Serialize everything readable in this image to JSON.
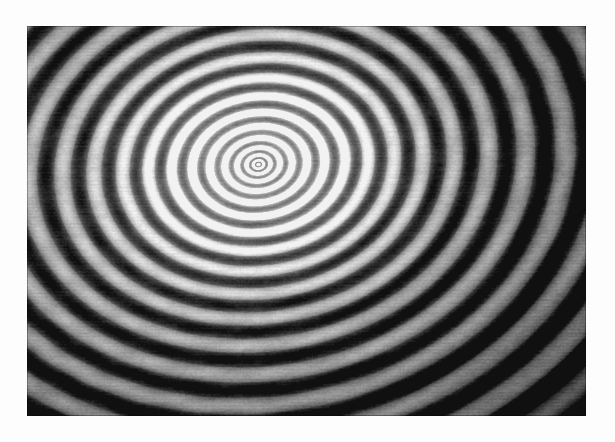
{
  "page": {
    "background_color": "#fdfdfd",
    "width": 615,
    "height": 442
  },
  "figure": {
    "name": "interference-fringe-photograph",
    "kind": "photographic-plate",
    "description": "Monochrome photographic plate showing concentric circular interference fringes (Fabry-Perot / Newton's rings) rendered elliptical by oblique viewing.",
    "plate": {
      "x": 27,
      "y": 26,
      "width": 559,
      "height": 390,
      "border_color": "#8f8f8f",
      "tone_dark": "#2b2b2b",
      "tone_mid": "#8a8a8a",
      "tone_light": "#f2f2f2"
    }
  },
  "chart_data": {
    "type": "heatmap",
    "title": "",
    "subtitle": "",
    "xlabel": "",
    "ylabel": "",
    "legend": [],
    "annotations": [],
    "grid": false,
    "pattern": "concentric-interference-fringes",
    "center": {
      "x": 258,
      "y": 164
    },
    "ellipse": {
      "aspect_ratio_x": 1.0,
      "aspect_ratio_y": 0.78,
      "rotation_deg": -8
    },
    "fringe": {
      "model": "cos^2 of sqrt(radius) phase  ->  Newton's-ring spacing",
      "phase_scale": 5.35,
      "phase_offset": 0.35,
      "contrast": 0.46,
      "sharpness": 1.55,
      "min_spacing_px": 1.2,
      "max_spacing_px": 8.0,
      "visible_ring_count": 78
    },
    "illumination": {
      "halo_radius_px": 118,
      "halo_gain": 0.55,
      "base_level": 0.46,
      "vignette_strength": 0.34,
      "gradient_tilt_deg": 205
    },
    "noise": {
      "grain_amplitude": 0.075,
      "scan_line_amplitude": 0.035,
      "moire_amplitude": 0.055,
      "moire_period_px": 34
    },
    "samples": {
      "note": "Radial intensity profile sampled along the +x axis from the ring center (0..1 normalized grey, 0 = black).",
      "radius_px": [
        0,
        6,
        12,
        20,
        30,
        42,
        56,
        72,
        90,
        110,
        132,
        156,
        182,
        210,
        240,
        272,
        306
      ],
      "intensity": [
        0.62,
        0.41,
        0.78,
        0.44,
        0.86,
        0.4,
        0.88,
        0.38,
        0.82,
        0.34,
        0.7,
        0.3,
        0.58,
        0.26,
        0.5,
        0.24,
        0.44
      ]
    }
  }
}
